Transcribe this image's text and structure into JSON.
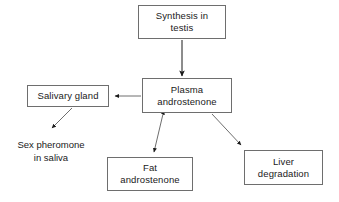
{
  "diagram": {
    "background_color": "#ffffff",
    "line_color": "#6e6e6e",
    "arrow_color": "#1a1a1a",
    "text_color": "#1a1a1a",
    "nodes": [
      {
        "id": "synthesis",
        "label": "Synthesis in\ntestis",
        "boxed": true
      },
      {
        "id": "plasma",
        "label": "Plasma\nandrostenone",
        "boxed": true
      },
      {
        "id": "salivary",
        "label": "Salivary gland",
        "boxed": true
      },
      {
        "id": "fat",
        "label": "Fat\nandrostenone",
        "boxed": true
      },
      {
        "id": "liver",
        "label": "Liver\ndegradation",
        "boxed": true
      },
      {
        "id": "pheromone",
        "label": "Sex pheromone\nin saliva",
        "boxed": false
      }
    ],
    "edges": [
      {
        "id": "synthesis-to-plasma",
        "from": "synthesis",
        "to": "plasma",
        "style": "solid",
        "heads": "end"
      },
      {
        "id": "plasma-to-salivary",
        "from": "plasma",
        "to": "salivary",
        "style": "solid",
        "heads": "end"
      },
      {
        "id": "salivary-to-pheromone",
        "from": "salivary",
        "to": "pheromone",
        "style": "solid",
        "heads": "end"
      },
      {
        "id": "plasma-to-fat",
        "from": "plasma",
        "to": "fat",
        "style": "solid",
        "heads": "both"
      },
      {
        "id": "plasma-to-liver",
        "from": "plasma",
        "to": "liver",
        "style": "solid",
        "heads": "end"
      }
    ]
  }
}
